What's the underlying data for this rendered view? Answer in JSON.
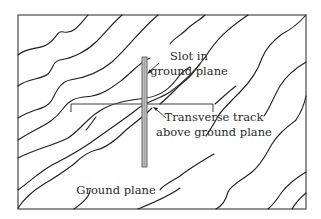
{
  "figure": {
    "labels": {
      "slot_line1": "Slot in",
      "slot_line2": "ground plane",
      "track_line1": "Transverse track",
      "track_line2": "above ground plane",
      "ground_plane": "Ground plane"
    },
    "colors": {
      "line": "#1e1e1e",
      "frame": "#3a3a3a",
      "slot_fill": "#bdbdbd",
      "background": "#ffffff"
    }
  }
}
